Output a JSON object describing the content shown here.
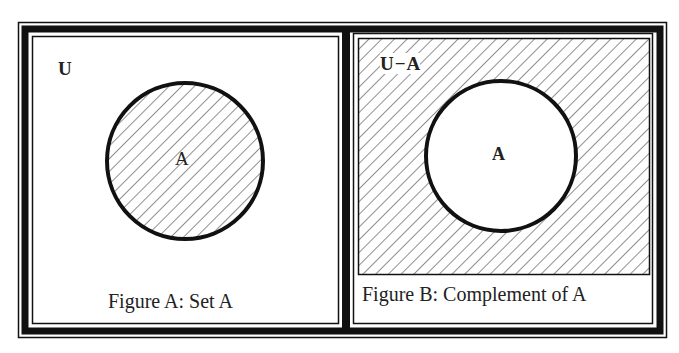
{
  "colors": {
    "ink": "#111111",
    "background": "#ffffff",
    "hatch": "#333333"
  },
  "figures": [
    {
      "id": "figure-a",
      "universe_label": "U",
      "set_label": "A",
      "caption": "Figure A: Set A",
      "shaded_region": "A"
    },
    {
      "id": "figure-b",
      "universe_label": "U − A",
      "universe_label_left": "U",
      "universe_label_op": "−",
      "universe_label_right": "A",
      "set_label": "A",
      "caption": "Figure B: Complement of A",
      "shaded_region": "U - A"
    }
  ]
}
